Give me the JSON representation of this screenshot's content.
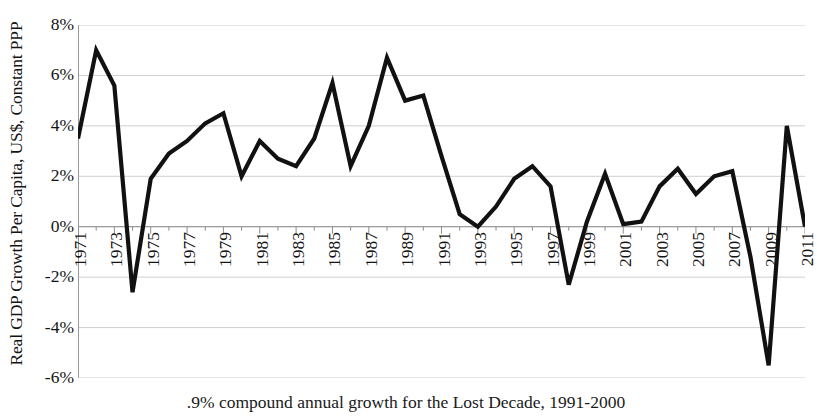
{
  "chart_data": {
    "type": "line",
    "title": "",
    "xlabel": "",
    "ylabel": "Real GDP Growth Per Capita, US$, Constant PPP",
    "caption": ".9% compound annual growth for the Lost Decade, 1991-2000",
    "ylim": [
      -6,
      8
    ],
    "ytick_values": [
      8,
      6,
      4,
      2,
      0,
      -2,
      -4,
      -6
    ],
    "ytick_labels": [
      "8%",
      "6%",
      "4%",
      "2%",
      "0%",
      "-2%",
      "-4%",
      "-6%"
    ],
    "xlim": [
      1971,
      2011
    ],
    "xtick_values": [
      1971,
      1973,
      1975,
      1977,
      1979,
      1981,
      1983,
      1985,
      1987,
      1989,
      1991,
      1993,
      1995,
      1997,
      1999,
      2001,
      2003,
      2005,
      2007,
      2009,
      2011
    ],
    "xtick_labels": [
      "1971",
      "1973",
      "1975",
      "1977",
      "1979",
      "1981",
      "1983",
      "1985",
      "1987",
      "1989",
      "1991",
      "1993",
      "1995",
      "1997",
      "1999",
      "2001",
      "2003",
      "2005",
      "2007",
      "2009",
      "2011"
    ],
    "grid": true,
    "grid_axis": "y",
    "legend": "none",
    "line_color": "#111111",
    "line_width": 4.2,
    "x": [
      1971,
      1972,
      1973,
      1974,
      1975,
      1976,
      1977,
      1978,
      1979,
      1980,
      1981,
      1982,
      1983,
      1984,
      1985,
      1986,
      1987,
      1988,
      1989,
      1990,
      1991,
      1992,
      1993,
      1994,
      1995,
      1996,
      1997,
      1998,
      1999,
      2000,
      2001,
      2002,
      2003,
      2004,
      2005,
      2006,
      2007,
      2008,
      2009,
      2010,
      2011
    ],
    "values": [
      3.5,
      7.0,
      5.6,
      -2.6,
      1.9,
      2.9,
      3.4,
      4.1,
      4.5,
      2.0,
      3.4,
      2.7,
      2.4,
      3.5,
      5.7,
      2.4,
      4.0,
      6.7,
      5.0,
      5.2,
      2.8,
      0.5,
      0.0,
      0.8,
      1.9,
      2.4,
      1.6,
      -2.3,
      0.2,
      2.1,
      0.1,
      0.2,
      1.6,
      2.3,
      1.3,
      2.0,
      2.2,
      -1.2,
      -5.5,
      4.0,
      0.0
    ],
    "series": [
      {
        "name": "Real GDP Growth Per Capita",
        "values": [
          3.5,
          7.0,
          5.6,
          -2.6,
          1.9,
          2.9,
          3.4,
          4.1,
          4.5,
          2.0,
          3.4,
          2.7,
          2.4,
          3.5,
          5.7,
          2.4,
          4.0,
          6.7,
          5.0,
          5.2,
          2.8,
          0.5,
          0.0,
          0.8,
          1.9,
          2.4,
          1.6,
          -2.3,
          0.2,
          2.1,
          0.1,
          0.2,
          1.6,
          2.3,
          1.3,
          2.0,
          2.2,
          -1.2,
          -5.5,
          4.0,
          0.0
        ]
      }
    ]
  }
}
